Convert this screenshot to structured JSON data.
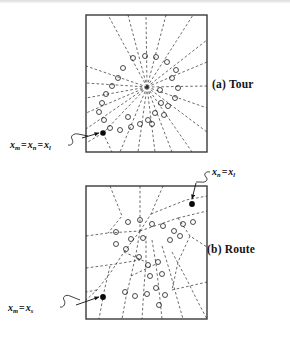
{
  "figure": {
    "background_color": "#ffffff",
    "ink_color": "#1a1a1a",
    "panels": [
      {
        "id": "a",
        "caption": "(a) Tour",
        "frame": {
          "x": 86,
          "y": 15,
          "width": 121,
          "height": 137
        },
        "partition_style": "radial-fan",
        "hub": {
          "x": 147,
          "y": 87
        },
        "depot_count": 1,
        "depots": [
          {
            "x": 103,
            "y": 133,
            "label_ref": "lab-a"
          }
        ],
        "customer_count": 27,
        "customers": [
          {
            "x": 123,
            "y": 68
          },
          {
            "x": 133,
            "y": 58
          },
          {
            "x": 145,
            "y": 56
          },
          {
            "x": 156,
            "y": 57
          },
          {
            "x": 167,
            "y": 62
          },
          {
            "x": 176,
            "y": 70
          },
          {
            "x": 172,
            "y": 78
          },
          {
            "x": 178,
            "y": 88
          },
          {
            "x": 175,
            "y": 98
          },
          {
            "x": 168,
            "y": 106
          },
          {
            "x": 164,
            "y": 115
          },
          {
            "x": 155,
            "y": 113
          },
          {
            "x": 148,
            "y": 120
          },
          {
            "x": 140,
            "y": 124
          },
          {
            "x": 131,
            "y": 127
          },
          {
            "x": 120,
            "y": 130
          },
          {
            "x": 110,
            "y": 128
          },
          {
            "x": 104,
            "y": 120
          },
          {
            "x": 99,
            "y": 112
          },
          {
            "x": 102,
            "y": 103
          },
          {
            "x": 106,
            "y": 94
          },
          {
            "x": 112,
            "y": 86
          },
          {
            "x": 118,
            "y": 78
          },
          {
            "x": 160,
            "y": 90
          },
          {
            "x": 161,
            "y": 103
          },
          {
            "x": 152,
            "y": 124
          },
          {
            "x": 128,
            "y": 117
          }
        ]
      },
      {
        "id": "b",
        "caption": "(b) Route",
        "frame": {
          "x": 86,
          "y": 186,
          "width": 121,
          "height": 133
        },
        "partition_style": "irregular-polygons",
        "depot_count": 2,
        "depots": [
          {
            "x": 192,
            "y": 204,
            "label_ref": "lab-b1"
          },
          {
            "x": 103,
            "y": 297,
            "label_ref": "lab-b2"
          }
        ],
        "customer_count": 25,
        "customers": [
          {
            "x": 116,
            "y": 232
          },
          {
            "x": 128,
            "y": 222
          },
          {
            "x": 140,
            "y": 220
          },
          {
            "x": 152,
            "y": 224
          },
          {
            "x": 163,
            "y": 226
          },
          {
            "x": 174,
            "y": 231
          },
          {
            "x": 183,
            "y": 224
          },
          {
            "x": 193,
            "y": 222
          },
          {
            "x": 116,
            "y": 244
          },
          {
            "x": 126,
            "y": 249
          },
          {
            "x": 131,
            "y": 239
          },
          {
            "x": 143,
            "y": 238
          },
          {
            "x": 170,
            "y": 240
          },
          {
            "x": 180,
            "y": 236
          },
          {
            "x": 139,
            "y": 257
          },
          {
            "x": 148,
            "y": 265
          },
          {
            "x": 158,
            "y": 262
          },
          {
            "x": 150,
            "y": 276
          },
          {
            "x": 162,
            "y": 274
          },
          {
            "x": 156,
            "y": 288
          },
          {
            "x": 165,
            "y": 295
          },
          {
            "x": 125,
            "y": 292
          },
          {
            "x": 135,
            "y": 296
          },
          {
            "x": 147,
            "y": 294
          },
          {
            "x": 159,
            "y": 305
          }
        ]
      }
    ],
    "annotations": [
      {
        "id": "lab-a",
        "panel": "a",
        "text_plain": "x_m = x_n = x_l",
        "terms": [
          {
            "var": "x",
            "sub": "m"
          },
          {
            "var": "x",
            "sub": "n"
          },
          {
            "var": "x",
            "sub": "l"
          }
        ],
        "equals": "=",
        "points_to": {
          "x": 103,
          "y": 133
        }
      },
      {
        "id": "lab-b1",
        "panel": "b",
        "text_plain": "x_n = x_l",
        "terms": [
          {
            "var": "x",
            "sub": "n"
          },
          {
            "var": "x",
            "sub": "l"
          }
        ],
        "equals": "=",
        "points_to": {
          "x": 192,
          "y": 204
        }
      },
      {
        "id": "lab-b2",
        "panel": "b",
        "text_plain": "x_m = x_s",
        "terms": [
          {
            "var": "x",
            "sub": "m"
          },
          {
            "var": "x",
            "sub": "s"
          }
        ],
        "equals": "=",
        "points_to": {
          "x": 103,
          "y": 297
        }
      }
    ],
    "legend_notes": {
      "open_circle_meaning": "customer location",
      "filled_dot_meaning": "depot / start point",
      "dashed_line_meaning": "partition boundary"
    }
  }
}
